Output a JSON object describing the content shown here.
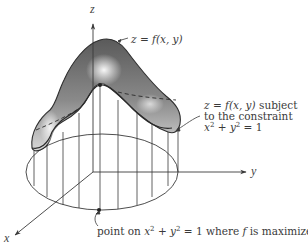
{
  "figure": {
    "axes": {
      "x_label": "x",
      "y_label": "y",
      "z_label": "z"
    },
    "annotations": {
      "surface": {
        "lhs": "z",
        "eq": " = ",
        "fn": "f",
        "args": "(x, y)"
      },
      "constrained": {
        "line1_lhs": "z",
        "line1_eq": " = ",
        "line1_fn": "f",
        "line1_args": "(x, y)",
        "line1_rest": " subject",
        "line2": "to the constraint",
        "line3_x": "x",
        "line3_exp1": "2",
        "line3_plus": " + ",
        "line3_y": "y",
        "line3_exp2": "2",
        "line3_rest": " = 1"
      },
      "max_point": {
        "pre": "point on ",
        "x": "x",
        "exp1": "2",
        "plus": " + ",
        "y": "y",
        "exp2": "2",
        "mid": " = 1 where ",
        "f": "f",
        "post": " is maximized"
      }
    },
    "colors": {
      "line": "#3a3a3a",
      "surface_dark": "#5e5e5e",
      "surface_light": "#f2f2f2",
      "text": "#3a3a3a"
    }
  }
}
